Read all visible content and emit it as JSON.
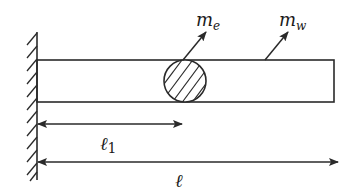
{
  "diagram": {
    "colors": {
      "stroke": "#2a2a2a",
      "background": "#ffffff"
    },
    "labels": {
      "eccentric_mass": {
        "base": "m",
        "sub": "e"
      },
      "beam_mass": {
        "base": "m",
        "sub": "w"
      },
      "mass_position": {
        "base": "ℓ",
        "sub": "1"
      },
      "beam_length": {
        "base": "ℓ"
      }
    },
    "elements": {
      "wall": "fixed-support-hatched",
      "beam": "rectangle",
      "mass": "hatched-circle"
    }
  }
}
